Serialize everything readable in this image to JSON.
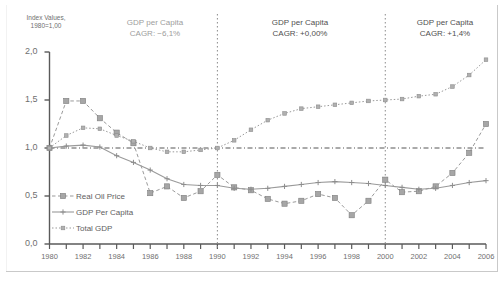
{
  "chart_data": {
    "type": "line",
    "title": "",
    "xlabel": "",
    "ylabel": "Index Values, 1980=1,00",
    "ylabel_line1": "Index Values,",
    "ylabel_line2": "1980=1,00",
    "xlim": [
      1980,
      2006
    ],
    "ylim": [
      0.0,
      2.0
    ],
    "grid": false,
    "legend_position": "inside-bottom-left",
    "y_ticks": [
      0.0,
      0.5,
      1.0,
      1.5,
      2.0
    ],
    "y_tick_labels": [
      "0,0",
      "0,5",
      "1,0",
      "1,5",
      "2,0"
    ],
    "x_ticks": [
      1980,
      1982,
      1984,
      1986,
      1988,
      1990,
      1992,
      1994,
      1996,
      1998,
      2000,
      2002,
      2004,
      2006
    ],
    "x_tick_labels": [
      "1980",
      "1982",
      "1984",
      "1986",
      "1988",
      "1990",
      "1992",
      "1994",
      "1996",
      "1998",
      "2000",
      "2002",
      "2004",
      "2006"
    ],
    "x": [
      1980,
      1981,
      1982,
      1983,
      1984,
      1985,
      1986,
      1987,
      1988,
      1989,
      1990,
      1991,
      1992,
      1993,
      1994,
      1995,
      1996,
      1997,
      1998,
      1999,
      2000,
      2001,
      2002,
      2003,
      2004,
      2005,
      2006
    ],
    "reference_line": {
      "y": 1.0,
      "style": "dash-dot",
      "color": "#555555"
    },
    "dividers": [
      {
        "x": 1990,
        "style": "dotted",
        "color": "#8a8a8a"
      },
      {
        "x": 2000,
        "style": "dotted",
        "color": "#8a8a8a"
      }
    ],
    "series": [
      {
        "name": "Real Oil Price",
        "color": "#9a9a9a",
        "line_style": "dashed",
        "marker": "square",
        "values": [
          1.0,
          1.49,
          1.49,
          1.31,
          1.16,
          1.05,
          0.53,
          0.6,
          0.48,
          0.55,
          0.72,
          0.59,
          0.56,
          0.47,
          0.42,
          0.45,
          0.52,
          0.48,
          0.3,
          0.45,
          0.67,
          0.54,
          0.55,
          0.6,
          0.74,
          0.95,
          1.25
        ]
      },
      {
        "name": "GDP Per Capita",
        "color": "#9a9a9a",
        "line_style": "solid",
        "marker": "plus",
        "values": [
          1.0,
          1.02,
          1.03,
          1.01,
          0.92,
          0.85,
          0.77,
          0.68,
          0.62,
          0.61,
          0.61,
          0.58,
          0.57,
          0.58,
          0.6,
          0.62,
          0.64,
          0.65,
          0.64,
          0.63,
          0.61,
          0.59,
          0.57,
          0.58,
          0.61,
          0.64,
          0.66
        ]
      },
      {
        "name": "Total GDP",
        "color": "#9a9a9a",
        "line_style": "dotted",
        "marker": "small-square",
        "values": [
          1.0,
          1.13,
          1.21,
          1.2,
          1.13,
          1.07,
          1.0,
          0.96,
          0.96,
          0.98,
          1.0,
          1.08,
          1.19,
          1.29,
          1.36,
          1.41,
          1.43,
          1.45,
          1.47,
          1.49,
          1.5,
          1.51,
          1.54,
          1.56,
          1.64,
          1.76,
          1.92
        ]
      }
    ],
    "annotations": [
      {
        "line1": "GDP per Capita",
        "line2": "CAGR: −6,1%",
        "period": "1980-1990"
      },
      {
        "line1": "GDP per Capita",
        "line2": "CAGR: +0,00%",
        "period": "1990-2000"
      },
      {
        "line1": "GDP per Capita",
        "line2": "CAGR: +1,4%",
        "period": "2000-2006"
      }
    ]
  }
}
